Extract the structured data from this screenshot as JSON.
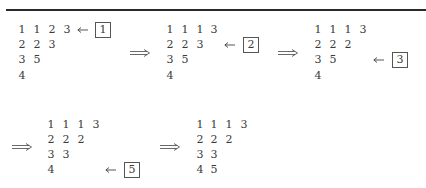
{
  "figure": {
    "tableaux": [
      {
        "rows": [
          [
            "1",
            "1",
            "2",
            "3"
          ],
          [
            "2",
            "2",
            "3"
          ],
          [
            "3",
            "5"
          ],
          [
            "4"
          ]
        ],
        "insert": {
          "value": "1",
          "row": 0
        }
      },
      {
        "rows": [
          [
            "1",
            "1",
            "1",
            "3"
          ],
          [
            "2",
            "2",
            "3"
          ],
          [
            "3",
            "5"
          ],
          [
            "4"
          ]
        ],
        "insert": {
          "value": "2",
          "row": 1
        }
      },
      {
        "rows": [
          [
            "1",
            "1",
            "1",
            "3"
          ],
          [
            "2",
            "2",
            "2"
          ],
          [
            "3",
            "5"
          ],
          [
            "4"
          ]
        ],
        "insert": {
          "value": "3",
          "row": 2
        }
      },
      {
        "rows": [
          [
            "1",
            "1",
            "1",
            "3"
          ],
          [
            "2",
            "2",
            "2"
          ],
          [
            "3",
            "3"
          ],
          [
            "4"
          ]
        ],
        "insert": {
          "value": "5",
          "row": 3
        }
      },
      {
        "rows": [
          [
            "1",
            "1",
            "1",
            "3"
          ],
          [
            "2",
            "2",
            "2"
          ],
          [
            "3",
            "3"
          ],
          [
            "4",
            "5"
          ]
        ],
        "insert": null
      }
    ],
    "arrow_symbol": "⟹",
    "insert_arrow_symbol": "←"
  }
}
